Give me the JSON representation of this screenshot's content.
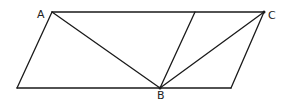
{
  "diagram": {
    "type": "geometry",
    "points": {
      "A": {
        "label": "A",
        "x": 52,
        "y": 12
      },
      "C": {
        "label": "C",
        "x": 264,
        "y": 12
      },
      "B": {
        "label": "B",
        "x": 160,
        "y": 88
      },
      "BL": {
        "x": 17,
        "y": 88
      },
      "BR": {
        "x": 231,
        "y": 88
      },
      "T": {
        "x": 195,
        "y": 12
      }
    },
    "labels": {
      "A": "A",
      "B": "B",
      "C": "C"
    },
    "segments": [
      [
        "A",
        "C"
      ],
      [
        "BL",
        "BR"
      ],
      [
        "BL",
        "A"
      ],
      [
        "BR",
        "C"
      ],
      [
        "A",
        "B"
      ],
      [
        "B",
        "C"
      ],
      [
        "B",
        "T"
      ]
    ],
    "stroke_color": "#1a1a1a"
  }
}
